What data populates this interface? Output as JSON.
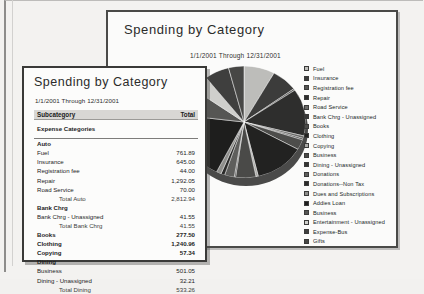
{
  "chart_window": {
    "title": "Spending by Category",
    "subtitle": "1/1/2001 Through 12/31/2001"
  },
  "report_window": {
    "title": "Spending by Category",
    "subtitle": "1/1/2001 Through 12/31/2001",
    "columns": {
      "category": "Subcategory",
      "total": "Total"
    },
    "section_header": "Expense Categories",
    "rows": [
      {
        "label": "Auto",
        "value": "",
        "style": "group"
      },
      {
        "label": "Fuel",
        "value": "761.89",
        "style": "item"
      },
      {
        "label": "Insurance",
        "value": "645.00",
        "style": "item"
      },
      {
        "label": "Registration fee",
        "value": "44.00",
        "style": "item"
      },
      {
        "label": "Repair",
        "value": "1,292.05",
        "style": "item"
      },
      {
        "label": "Road Service",
        "value": "70.00",
        "style": "item"
      },
      {
        "label": "Total Auto",
        "value": "2,812.94",
        "style": "total"
      },
      {
        "label": "Bank Chrg",
        "value": "",
        "style": "group"
      },
      {
        "label": "Bank Chrg - Unassigned",
        "value": "41.55",
        "style": "item"
      },
      {
        "label": "Total Bank Chrg",
        "value": "41.55",
        "style": "total"
      },
      {
        "label": "Books",
        "value": "277.50",
        "style": "bold"
      },
      {
        "label": "Clothing",
        "value": "1,240.96",
        "style": "bold"
      },
      {
        "label": "Copying",
        "value": "57.34",
        "style": "bold"
      },
      {
        "label": "Dining",
        "value": "",
        "style": "group"
      },
      {
        "label": "Business",
        "value": "501.05",
        "style": "item"
      },
      {
        "label": "Dining - Unassigned",
        "value": "32.21",
        "style": "item"
      },
      {
        "label": "Total Dining",
        "value": "533.26",
        "style": "total"
      }
    ]
  },
  "chart_data": {
    "type": "pie",
    "title": "Spending by Category",
    "subtitle": "1/1/2001 Through 12/31/2001",
    "legend_position": "right",
    "grid": false,
    "categories": [
      "Fuel",
      "Insurance",
      "Registration fee",
      "Repair",
      "Road Service",
      "Bank Chrg - Unassigned",
      "Books",
      "Clothing",
      "Copying",
      "Business",
      "Dining - Unassigned",
      "Donations",
      "Donations--Non Tax",
      "Dues and Subscriptions",
      "Addies Loan",
      "Business",
      "Entertainment - Unassigned",
      "Expense-Bus",
      "Gifts"
    ],
    "values": [
      761.89,
      645.0,
      44.0,
      1292.05,
      70.0,
      41.55,
      277.5,
      1240.96,
      57.34,
      501.05,
      32.21,
      240.0,
      95.0,
      120.0,
      1850.0,
      760.0,
      430.0,
      610.0,
      380.0
    ],
    "colors": [
      "#bdbdba",
      "#3c3c3b",
      "#545452",
      "#2e2e2d",
      "#6a6a68",
      "#3a3a39",
      "#4d4d4b",
      "#222221",
      "#a9a9a6",
      "#4a4a48",
      "#343433",
      "#5e5e5c",
      "#2b2b2a",
      "#8e8e8b",
      "#1e1e1d",
      "#565654",
      "#cfcfcc",
      "#3f3f3e",
      "#474745"
    ]
  }
}
